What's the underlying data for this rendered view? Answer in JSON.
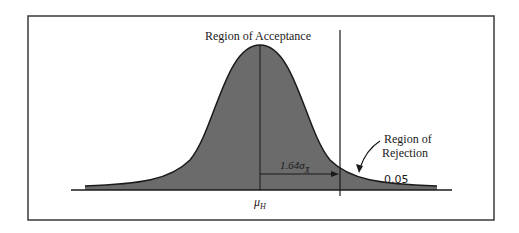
{
  "diagram": {
    "type": "normal-distribution-hypothesis-test",
    "labels": {
      "acceptance": "Region of Acceptance",
      "rejection_line1": "Region of",
      "rejection_line2": "Rejection",
      "distance_main": "1.64σ",
      "distance_sub": "X̄",
      "alpha": "0.05",
      "mean_main": "μ",
      "mean_sub": "H"
    },
    "colors": {
      "fill": "#6b6b6b",
      "stroke": "#1a1a1a",
      "frame": "#3a3a3a",
      "background": "#ffffff"
    }
  }
}
